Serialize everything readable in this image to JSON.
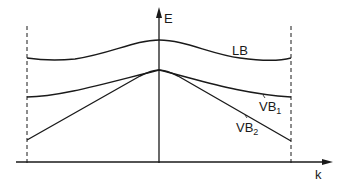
{
  "diagram": {
    "type": "band-structure",
    "axes": {
      "y_label": "E",
      "x_label": "k"
    },
    "bands": [
      {
        "id": "LB",
        "label": "LB",
        "label_sub": ""
      },
      {
        "id": "VB1",
        "label": "VB",
        "label_sub": "1"
      },
      {
        "id": "VB2",
        "label": "VB",
        "label_sub": "2"
      }
    ],
    "boundaries": [
      "left-zone-boundary",
      "right-zone-boundary"
    ],
    "colors": {
      "line": "#1a1a1a",
      "background": "#ffffff"
    }
  }
}
